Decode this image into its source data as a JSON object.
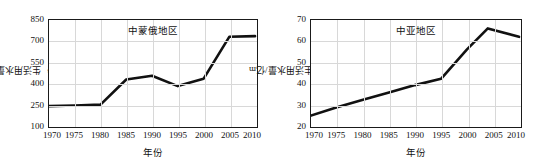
{
  "figure": {
    "background": "#ffffff",
    "line_color": "#111111",
    "grid_color": "#d8d8d8"
  },
  "chart_data": [
    {
      "type": "line",
      "title": "中蒙俄地区",
      "xlabel": "年份",
      "ylabel": "生活用水量/亿m",
      "ylabel_sup": "3",
      "x": [
        1970,
        1975,
        1980,
        1985,
        1990,
        1995,
        2000,
        2005,
        2010
      ],
      "values": [
        235,
        240,
        246,
        425,
        452,
        378,
        430,
        730,
        735
      ],
      "xticks": [
        "1970",
        "1975",
        "1980",
        "1985",
        "1990",
        "1995",
        "2000",
        "2005",
        "2010"
      ],
      "yticks": [
        "100",
        "250",
        "400",
        "550",
        "700",
        "850"
      ],
      "ytickvals": [
        100,
        250,
        400,
        550,
        700,
        850
      ],
      "xlim": [
        1970,
        2010
      ],
      "ylim": [
        100,
        850
      ],
      "grid": true,
      "legend": "none"
    },
    {
      "type": "line",
      "title": "中亚地区",
      "xlabel": "年份",
      "ylabel": "生活用水量/亿m",
      "ylabel_sup": "3",
      "x": [
        1970,
        1975,
        1980,
        1985,
        1990,
        1995,
        2000,
        2004,
        2010
      ],
      "values": [
        24.5,
        28.5,
        32,
        35.5,
        39,
        42,
        56,
        66,
        62
      ],
      "xticks": [
        "1970",
        "1975",
        "1980",
        "1985",
        "1990",
        "1995",
        "2000",
        "2005",
        "2010"
      ],
      "yticks": [
        "20",
        "30",
        "40",
        "50",
        "60",
        "70"
      ],
      "ytickvals": [
        20,
        30,
        40,
        50,
        60,
        70
      ],
      "xlim": [
        1970,
        2010
      ],
      "ylim": [
        20,
        70
      ],
      "grid": true,
      "legend": "none"
    }
  ]
}
